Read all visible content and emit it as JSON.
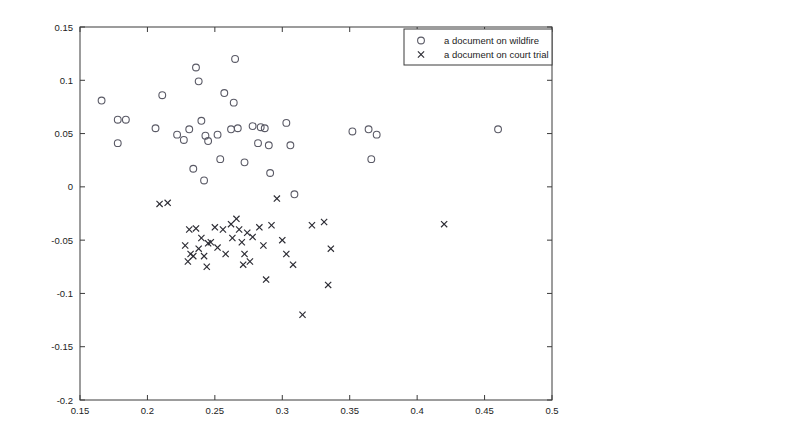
{
  "chart_data": {
    "type": "scatter",
    "title": "",
    "xlabel": "",
    "ylabel": "",
    "xlim": [
      0.15,
      0.5
    ],
    "ylim": [
      -0.2,
      0.15
    ],
    "xticks": [
      0.15,
      0.2,
      0.25,
      0.3,
      0.35,
      0.4,
      0.45,
      0.5
    ],
    "xticklabels": [
      "0.15",
      "0.2",
      "0.25",
      "0.3",
      "0.35",
      "0.4",
      "0.45",
      "0.5"
    ],
    "yticks": [
      -0.2,
      -0.15,
      -0.1,
      -0.05,
      0,
      0.05,
      0.1,
      0.15
    ],
    "yticklabels": [
      "-0.2",
      "-0.15",
      "-0.1",
      "-0.05",
      "0",
      "0.05",
      "0.1",
      "0.15"
    ],
    "grid": false,
    "legend_position": "upper right",
    "series": [
      {
        "name": "a document on wildfire",
        "marker": "circle",
        "color": "#5a5a66",
        "points": [
          [
            0.166,
            0.081
          ],
          [
            0.178,
            0.063
          ],
          [
            0.184,
            0.063
          ],
          [
            0.178,
            0.041
          ],
          [
            0.206,
            0.055
          ],
          [
            0.211,
            0.086
          ],
          [
            0.222,
            0.049
          ],
          [
            0.227,
            0.044
          ],
          [
            0.231,
            0.054
          ],
          [
            0.236,
            0.112
          ],
          [
            0.238,
            0.099
          ],
          [
            0.234,
            0.017
          ],
          [
            0.24,
            0.062
          ],
          [
            0.243,
            0.048
          ],
          [
            0.245,
            0.043
          ],
          [
            0.242,
            0.006
          ],
          [
            0.252,
            0.049
          ],
          [
            0.254,
            0.026
          ],
          [
            0.257,
            0.088
          ],
          [
            0.265,
            0.12
          ],
          [
            0.264,
            0.079
          ],
          [
            0.262,
            0.054
          ],
          [
            0.267,
            0.055
          ],
          [
            0.272,
            0.023
          ],
          [
            0.278,
            0.057
          ],
          [
            0.284,
            0.056
          ],
          [
            0.287,
            0.055
          ],
          [
            0.291,
            0.013
          ],
          [
            0.282,
            0.041
          ],
          [
            0.29,
            0.039
          ],
          [
            0.303,
            0.06
          ],
          [
            0.306,
            0.039
          ],
          [
            0.309,
            -0.007
          ],
          [
            0.352,
            0.052
          ],
          [
            0.364,
            0.054
          ],
          [
            0.37,
            0.049
          ],
          [
            0.366,
            0.026
          ],
          [
            0.46,
            0.054
          ]
        ]
      },
      {
        "name": "a document on court trial",
        "marker": "x",
        "color": "#2b2b33",
        "points": [
          [
            0.209,
            -0.016
          ],
          [
            0.215,
            -0.015
          ],
          [
            0.231,
            -0.04
          ],
          [
            0.236,
            -0.039
          ],
          [
            0.24,
            -0.048
          ],
          [
            0.228,
            -0.055
          ],
          [
            0.232,
            -0.063
          ],
          [
            0.234,
            -0.065
          ],
          [
            0.23,
            -0.07
          ],
          [
            0.238,
            -0.058
          ],
          [
            0.242,
            -0.065
          ],
          [
            0.245,
            -0.053
          ],
          [
            0.247,
            -0.052
          ],
          [
            0.244,
            -0.075
          ],
          [
            0.25,
            -0.038
          ],
          [
            0.252,
            -0.057
          ],
          [
            0.256,
            -0.04
          ],
          [
            0.258,
            -0.063
          ],
          [
            0.262,
            -0.035
          ],
          [
            0.263,
            -0.048
          ],
          [
            0.266,
            -0.03
          ],
          [
            0.268,
            -0.04
          ],
          [
            0.27,
            -0.052
          ],
          [
            0.272,
            -0.063
          ],
          [
            0.274,
            -0.043
          ],
          [
            0.271,
            -0.073
          ],
          [
            0.276,
            -0.07
          ],
          [
            0.278,
            -0.047
          ],
          [
            0.283,
            -0.038
          ],
          [
            0.286,
            -0.055
          ],
          [
            0.288,
            -0.087
          ],
          [
            0.292,
            -0.036
          ],
          [
            0.296,
            -0.011
          ],
          [
            0.3,
            -0.05
          ],
          [
            0.303,
            -0.063
          ],
          [
            0.308,
            -0.073
          ],
          [
            0.315,
            -0.12
          ],
          [
            0.322,
            -0.036
          ],
          [
            0.331,
            -0.033
          ],
          [
            0.334,
            -0.092
          ],
          [
            0.336,
            -0.058
          ],
          [
            0.42,
            -0.035
          ]
        ]
      }
    ]
  },
  "legend": {
    "entries": [
      {
        "symbol": "o",
        "label": "a document on wildfire"
      },
      {
        "symbol": "×",
        "label": "a document on court trial"
      }
    ]
  }
}
